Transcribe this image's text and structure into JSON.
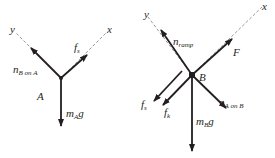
{
  "left_diagram": {
    "body_label": "A",
    "axes": {
      "x": "x",
      "y": "y"
    },
    "forces": {
      "normal": {
        "base": "n",
        "sub": "B on A"
      },
      "static_friction": {
        "base": "f",
        "sub": "s"
      },
      "weight": {
        "base": "m",
        "sub": "A",
        "tail": "g"
      }
    }
  },
  "right_diagram": {
    "body_label": "B",
    "axes": {
      "x": "x",
      "y": "y"
    },
    "forces": {
      "normal_ramp": {
        "base": "n",
        "sub": "ramp"
      },
      "applied": {
        "base": "F"
      },
      "normal_a_on_b": {
        "base": "n",
        "sub": "A on B"
      },
      "weight": {
        "base": "m",
        "sub": "B",
        "tail": "g"
      },
      "static_friction": {
        "base": "f",
        "sub": "s"
      },
      "kinetic_friction": {
        "base": "f",
        "sub": "k"
      }
    }
  },
  "colors": {
    "ink": "#231f20",
    "axis": "#9a9a9a",
    "background": "#ffffff"
  }
}
